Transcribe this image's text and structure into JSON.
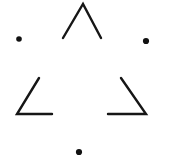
{
  "figure": {
    "canvas": {
      "width": 181,
      "height": 165,
      "background": "#ffffff"
    },
    "ink_color": "#161616",
    "stroke_width": 2.2,
    "dot_color": "#111111",
    "elements": [
      {
        "name": "top-chevron",
        "kind": "polyline",
        "points": "63,38 83,4 101,38",
        "stroke_width": 2.4
      },
      {
        "name": "bottom-left-angle",
        "kind": "polyline",
        "points": "39,78 17,114 52,114",
        "stroke_width": 2.4
      },
      {
        "name": "bottom-right-angle",
        "kind": "polyline",
        "points": "121,78 146,114 108,114",
        "stroke_width": 2.4
      }
    ],
    "dots": [
      {
        "name": "left-dot",
        "cx": 19,
        "cy": 39,
        "r": 2.8
      },
      {
        "name": "right-dot",
        "cx": 146,
        "cy": 41,
        "r": 3.1
      },
      {
        "name": "bottom-dot",
        "cx": 79,
        "cy": 152,
        "r": 3.1
      }
    ]
  }
}
